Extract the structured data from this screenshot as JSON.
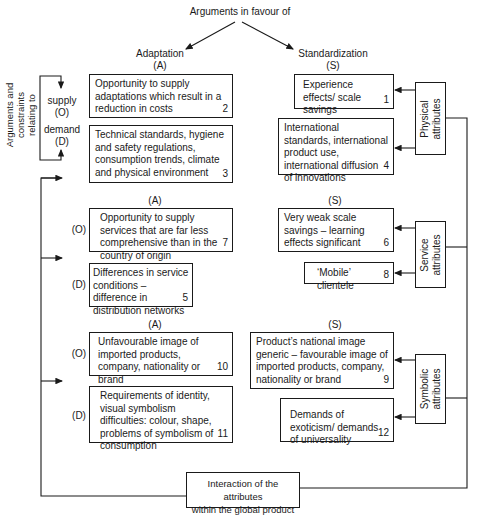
{
  "header": {
    "title": "Arguments in favour of",
    "left_heading": "Adaptation",
    "left_code": "(A)",
    "right_heading": "Standardization",
    "right_code": "(S)"
  },
  "side_label": {
    "line1": "Arguments and",
    "line2": "constraints",
    "line3": "relating to",
    "supply": "supply",
    "supply_code": "(O)",
    "demand": "demand",
    "demand_code": "(D)"
  },
  "sections": {
    "physical": {
      "attribute_label": [
        "Physical",
        "attributes"
      ],
      "adaptation": [
        {
          "text": "Opportunity to supply adaptations which result in a reduction in costs",
          "num": "2"
        },
        {
          "text": "Technical standards, hygiene and safety regulations, consumption trends, climate and physical environment",
          "num": "3"
        }
      ],
      "standardization": [
        {
          "text": "Experience effects/ scale savings",
          "num": "1"
        },
        {
          "text": "International standards, international product use, international diffusion of innovations",
          "num": "4"
        }
      ]
    },
    "service": {
      "attribute_label": [
        "Service",
        "attributes"
      ],
      "a_code": "(A)",
      "s_code": "(S)",
      "o_code": "(O)",
      "d_code": "(D)",
      "adaptation": [
        {
          "text": "Opportunity to supply services that are far less comprehensive than in the country of origin",
          "num": "7"
        },
        {
          "text": "Differences in service conditions – difference in distribution networks",
          "num": "5"
        }
      ],
      "standardization": [
        {
          "text": "Very weak scale savings – learning effects significant",
          "num": "6"
        },
        {
          "text": "‘Mobile’ clientele",
          "num": "8"
        }
      ]
    },
    "symbolic": {
      "attribute_label": [
        "Symbolic",
        "attributes"
      ],
      "a_code": "(A)",
      "s_code": "(S)",
      "o_code": "(O)",
      "d_code": "(D)",
      "adaptation": [
        {
          "text": "Unfavourable image of imported products, company, nationality or brand",
          "num": "10"
        },
        {
          "text": "Requirements of identity, visual symbolism difficulties: colour, shape, problems of symbolism of consumption",
          "num": "11"
        }
      ],
      "standardization": [
        {
          "text": "Product’s national image generic – favourable image of imported products, company, nationality or brand",
          "num": "9"
        },
        {
          "text": "Demands of exoticism/ demands of universality",
          "num": "12"
        }
      ]
    }
  },
  "footer": {
    "interaction": [
      "Interaction of the attributes",
      "within the global product"
    ]
  }
}
